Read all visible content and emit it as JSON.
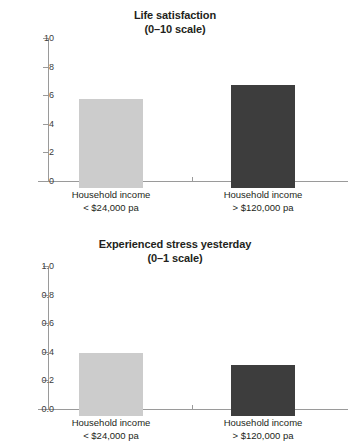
{
  "chart_data": [
    {
      "type": "bar",
      "title": "Life satisfaction",
      "subtitle": "(0–10 scale)",
      "xlabel": "",
      "ylabel": "",
      "ylim": [
        0,
        10
      ],
      "yticks": [
        "10",
        "8",
        "6",
        "4",
        "2",
        "0"
      ],
      "ytick_values": [
        10,
        8,
        6,
        4,
        2,
        0
      ],
      "grid": false,
      "legend": "none",
      "categories": [
        {
          "line1": "Household income",
          "line2": "< $24,000 pa"
        },
        {
          "line1": "Household income",
          "line2": "> $120,000 pa"
        }
      ],
      "values": [
        6.2,
        7.2
      ],
      "bar_colors": [
        "#cccccc",
        "#3d3d3d"
      ]
    },
    {
      "type": "bar",
      "title": "Experienced stress yesterday",
      "subtitle": "(0–1 scale)",
      "xlabel": "",
      "ylabel": "",
      "ylim": [
        0,
        1
      ],
      "yticks": [
        "1.0",
        "0.8",
        "0.6",
        "0.4",
        "0.2",
        "0.0"
      ],
      "ytick_values": [
        1.0,
        0.8,
        0.6,
        0.4,
        0.2,
        0.0
      ],
      "grid": false,
      "legend": "none",
      "categories": [
        {
          "line1": "Household income",
          "line2": "< $24,000 pa"
        },
        {
          "line1": "Household income",
          "line2": "> $120,000 pa"
        }
      ],
      "values": [
        0.44,
        0.36
      ],
      "bar_colors": [
        "#cccccc",
        "#3d3d3d"
      ]
    }
  ],
  "colors": {
    "bar_light": "#cccccc",
    "bar_dark": "#3d3d3d",
    "axis": "#9a9a9a",
    "text": "#231f20",
    "tick_text": "#3c3c3c",
    "background": "#ffffff"
  }
}
